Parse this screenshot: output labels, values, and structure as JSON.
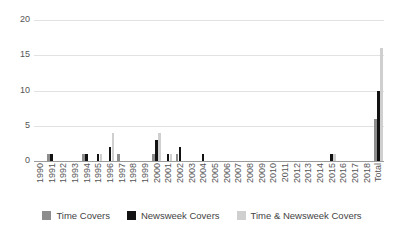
{
  "chart_data": {
    "type": "bar",
    "title": "",
    "subtitle": "",
    "xlabel": "",
    "ylabel": "",
    "ylim": [
      0,
      20
    ],
    "yticks": [
      0,
      5,
      10,
      15,
      20
    ],
    "grid": true,
    "legend_position": "bottom",
    "categories": [
      "1990",
      "1991",
      "1992",
      "1993",
      "1994",
      "1995",
      "1996",
      "1997",
      "1998",
      "1999",
      "2000",
      "2001",
      "2002",
      "2003",
      "2004",
      "2005",
      "2006",
      "2007",
      "2008",
      "2009",
      "2010",
      "2011",
      "2012",
      "2013",
      "2014",
      "2015",
      "2016",
      "2017",
      "2018",
      "Total"
    ],
    "series": [
      {
        "name": "Time Covers",
        "color": "#8d8d8d",
        "values": [
          0,
          1,
          0,
          0,
          1,
          0,
          0,
          1,
          0,
          0,
          1,
          0,
          1,
          0,
          0,
          0,
          0,
          0,
          0,
          0,
          0,
          0,
          0,
          0,
          0,
          0,
          0,
          0,
          0,
          6
        ]
      },
      {
        "name": "Newsweek Covers",
        "color": "#121212",
        "values": [
          0,
          1,
          0,
          0,
          1,
          1,
          2,
          0,
          0,
          0,
          3,
          1,
          2,
          0,
          1,
          0,
          0,
          0,
          0,
          0,
          0,
          0,
          0,
          0,
          0,
          1,
          0,
          0,
          0,
          10
        ]
      },
      {
        "name": "Time & Newsweek Covers",
        "color": "#cfcfcf",
        "values": [
          0,
          0,
          0,
          0,
          0,
          1,
          4,
          0,
          0,
          0,
          4,
          1,
          0,
          0,
          0,
          0,
          0,
          0,
          0,
          0,
          0,
          0,
          0,
          0,
          0,
          1,
          0,
          0,
          0,
          16
        ]
      }
    ]
  },
  "legend": {
    "items": [
      {
        "label": "Time Covers",
        "key": "time"
      },
      {
        "label": "Newsweek Covers",
        "key": "newsweek"
      },
      {
        "label": "Time & Newsweek Covers",
        "key": "both"
      }
    ]
  },
  "axes": {
    "y_tick_labels": [
      "20",
      "15",
      "10",
      "5",
      "0"
    ]
  }
}
